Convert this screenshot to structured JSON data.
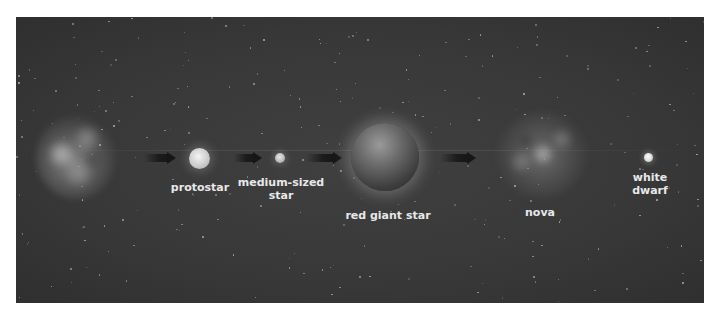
{
  "diagram": {
    "background_color": "#3a3a3a",
    "stages": [
      {
        "id": "nebula",
        "label": ""
      },
      {
        "id": "protostar",
        "label": "protostar"
      },
      {
        "id": "medium-sized-star",
        "label_line1": "medium-sized",
        "label_line2": "star"
      },
      {
        "id": "red-giant-star",
        "label": "red giant star"
      },
      {
        "id": "nova",
        "label": "nova"
      },
      {
        "id": "white-dwarf",
        "label_line1": "white",
        "label_line2": "dwarf"
      }
    ],
    "arrows": [
      {
        "from": "nebula",
        "to": "protostar"
      },
      {
        "from": "protostar",
        "to": "medium-sized-star"
      },
      {
        "from": "medium-sized-star",
        "to": "red-giant-star"
      },
      {
        "from": "red-giant-star",
        "to": "nova"
      }
    ]
  }
}
